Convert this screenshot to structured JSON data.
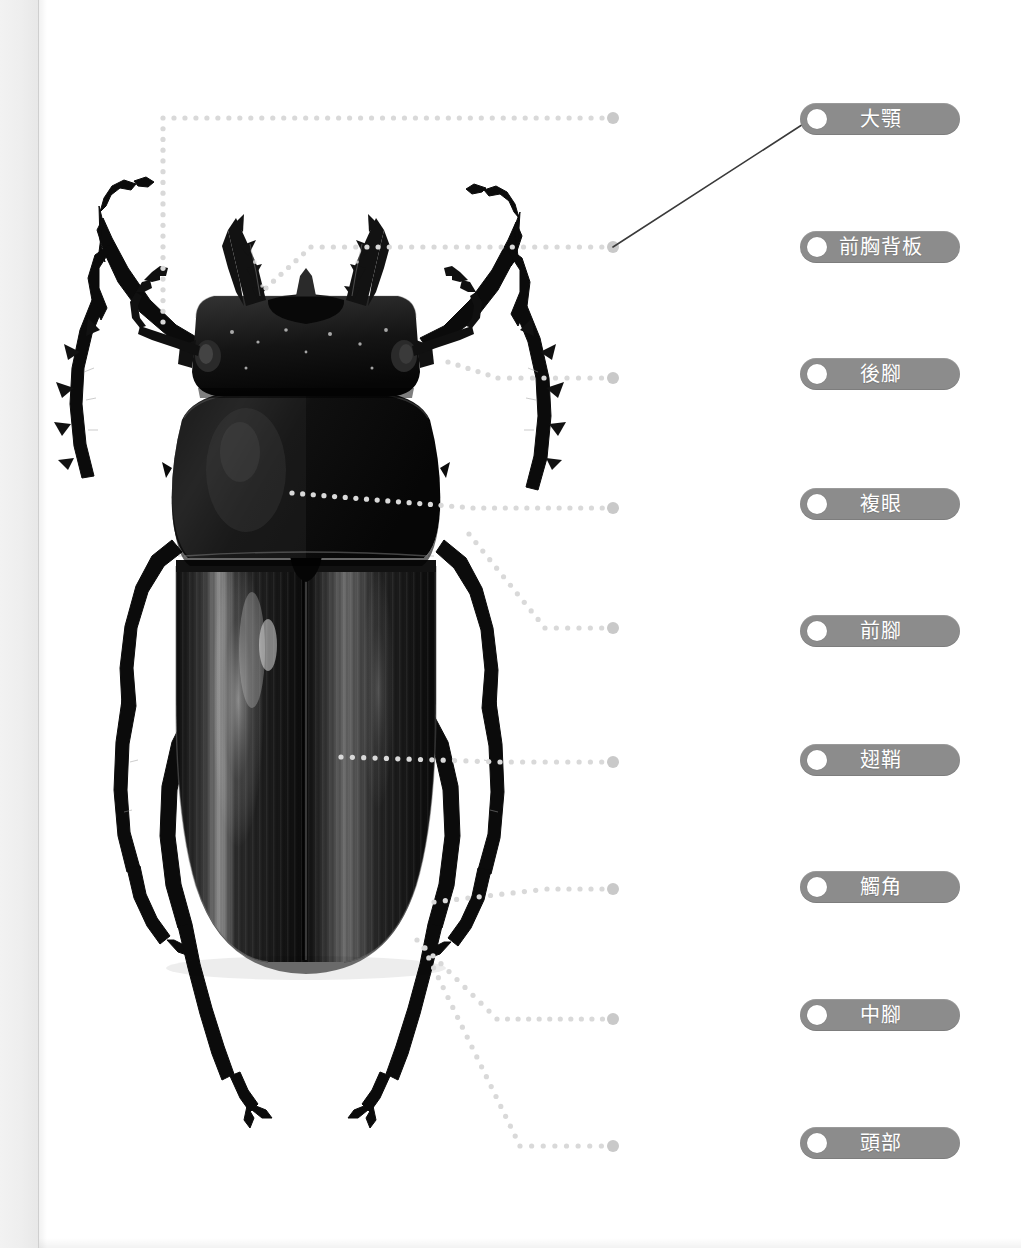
{
  "page": {
    "background": "#ffffff",
    "gutter_color": "#eeeeee",
    "width": 1021,
    "height": 1248
  },
  "specimen": {
    "name": "stag-beetle-dorsal-photo",
    "description": "黑色鍬形蟲背面照片",
    "colors": {
      "body": "#1a1a1a",
      "highlight": "#6e6e6e",
      "shadow": "#000000"
    }
  },
  "leader_lines": {
    "dot_color": "#d9d9d9",
    "endpoint_color": "#c9c9c9",
    "endpoint_x": 613,
    "dot_radius": 2.6,
    "endpoint_radius": 6,
    "paths": [
      {
        "name": "leader-1",
        "points": [
          [
            163,
            322
          ],
          [
            163,
            118
          ],
          [
            613,
            118
          ]
        ]
      },
      {
        "name": "leader-2",
        "points": [
          [
            266,
            288
          ],
          [
            311,
            247
          ],
          [
            613,
            247
          ]
        ]
      },
      {
        "name": "leader-3",
        "points": [
          [
            448,
            362
          ],
          [
            498,
            378
          ],
          [
            613,
            378
          ]
        ]
      },
      {
        "name": "leader-4",
        "points": [
          [
            292,
            493
          ],
          [
            473,
            508
          ],
          [
            613,
            508
          ]
        ]
      },
      {
        "name": "leader-5",
        "points": [
          [
            469,
            534
          ],
          [
            545,
            628
          ],
          [
            613,
            628
          ]
        ]
      },
      {
        "name": "leader-6",
        "points": [
          [
            341,
            757
          ],
          [
            500,
            762
          ],
          [
            613,
            762
          ]
        ]
      },
      {
        "name": "leader-7",
        "points": [
          [
            434,
            902
          ],
          [
            547,
            889
          ],
          [
            613,
            889
          ]
        ]
      },
      {
        "name": "leader-8",
        "points": [
          [
            417,
            940
          ],
          [
            497,
            1019
          ],
          [
            613,
            1019
          ]
        ]
      },
      {
        "name": "leader-9",
        "points": [
          [
            424,
            948
          ],
          [
            520,
            1146
          ],
          [
            613,
            1146
          ]
        ]
      }
    ]
  },
  "connector": {
    "name": "active-drag-connector",
    "color": "#3a3a3a",
    "width": 1.6,
    "from": [
      613,
      247
    ],
    "to": [
      811,
      119
    ]
  },
  "labels": {
    "pill_color": "#8c8c8c",
    "text_color": "#ffffff",
    "knob_color": "#ffffff",
    "left": 800,
    "items": [
      {
        "id": "label-mandible",
        "text": "大顎",
        "top": 103,
        "width": 160,
        "connected": true
      },
      {
        "id": "label-pronotum",
        "text": "前胸背板",
        "top": 231,
        "width": 160,
        "connected": false
      },
      {
        "id": "label-hindleg",
        "text": "後腳",
        "top": 358,
        "width": 160,
        "connected": false
      },
      {
        "id": "label-compoundeye",
        "text": "複眼",
        "top": 488,
        "width": 160,
        "connected": false
      },
      {
        "id": "label-foreleg",
        "text": "前腳",
        "top": 615,
        "width": 160,
        "connected": false
      },
      {
        "id": "label-elytra",
        "text": "翅鞘",
        "top": 744,
        "width": 160,
        "connected": false
      },
      {
        "id": "label-antenna",
        "text": "觸角",
        "top": 871,
        "width": 160,
        "connected": false
      },
      {
        "id": "label-midleg",
        "text": "中腳",
        "top": 999,
        "width": 160,
        "connected": false
      },
      {
        "id": "label-head",
        "text": "頭部",
        "top": 1127,
        "width": 160,
        "connected": false
      }
    ]
  }
}
